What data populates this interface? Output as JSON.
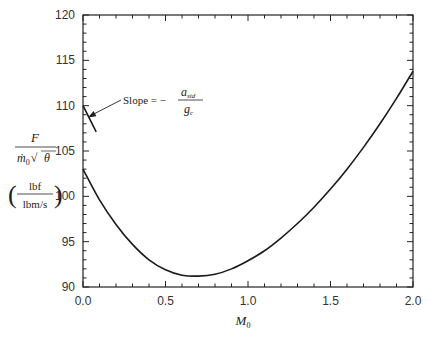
{
  "chart_data": {
    "type": "line",
    "title": "",
    "xlabel": "M",
    "xlabel_sub": "0",
    "ylabel": {
      "numerator": "F",
      "denominator_m": "ṁ",
      "denominator_sub": "0",
      "denominator_theta": "θ",
      "units_numerator": "lbf",
      "units_denominator": "lbm/s"
    },
    "xlim": [
      0.0,
      2.0
    ],
    "ylim": [
      90,
      120
    ],
    "x_ticks": [
      0.0,
      0.5,
      1.0,
      1.5,
      2.0
    ],
    "x_tick_labels": [
      "0.0",
      "0.5",
      "1.0",
      "1.5",
      "2.0"
    ],
    "y_ticks": [
      90,
      95,
      100,
      105,
      110,
      115,
      120
    ],
    "y_tick_labels": [
      "90",
      "95",
      "100",
      "105",
      "110",
      "115",
      "120"
    ],
    "x_minor_step": 0.1,
    "y_minor_step": 1,
    "grid": false,
    "series": [
      {
        "name": "specific thrust",
        "x": [
          0.0,
          0.1,
          0.2,
          0.3,
          0.4,
          0.5,
          0.6,
          0.7,
          0.8,
          0.9,
          1.0,
          1.1,
          1.2,
          1.3,
          1.4,
          1.5,
          1.6,
          1.7,
          1.8,
          1.9,
          2.0
        ],
        "y": [
          103.0,
          99.6,
          96.9,
          94.7,
          93.0,
          91.9,
          91.3,
          91.2,
          91.4,
          92.0,
          92.9,
          94.0,
          95.4,
          97.0,
          98.8,
          100.8,
          103.0,
          105.4,
          108.0,
          110.8,
          113.8
        ]
      }
    ],
    "annotation": {
      "text": "Slope = −",
      "fraction_numerator": "a",
      "fraction_numerator_sub": "std",
      "fraction_denominator": "g",
      "fraction_denominator_sub": "c",
      "slope_line": {
        "x": [
          0.0,
          0.08
        ],
        "y": [
          110.0,
          107.1
        ]
      },
      "arrow_target": {
        "x": 0.03,
        "y": 108.7
      }
    }
  }
}
